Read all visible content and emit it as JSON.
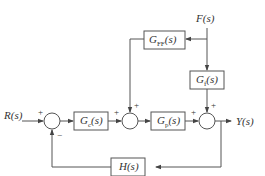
{
  "diagram": {
    "type": "control-block-diagram",
    "signals": {
      "input": "R(s)",
      "output": "Y(s)",
      "disturbance": "F(s)"
    },
    "blocks": {
      "controller": {
        "main": "G",
        "sub": "c",
        "arg": "(s)"
      },
      "plant": {
        "main": "G",
        "sub": "p",
        "arg": "(s)"
      },
      "feedforward": {
        "main": "G",
        "sub": "FF",
        "arg": "(s)"
      },
      "disturbance_path": {
        "main": "G",
        "sub": "f",
        "arg": "(s)"
      },
      "feedback": {
        "main": "H",
        "sub": "",
        "arg": "(s)"
      }
    },
    "summing_junctions": {
      "error": {
        "signs": {
          "left": "+",
          "bottom": "−"
        }
      },
      "feedforward_sum": {
        "signs": {
          "left": "+",
          "top": "+"
        }
      },
      "output_sum": {
        "signs": {
          "left": "+",
          "top": "+"
        }
      }
    },
    "connections": [
      "R(s) → error sum (+)",
      "error sum → Gc(s)",
      "Gc(s) → feedforward sum (+)",
      "F(s) → GFF(s) → feedforward sum (+)",
      "feedforward sum → Gp(s)",
      "Gp(s) → output sum (+)",
      "F(s) → Gf(s) → output sum (+)",
      "output sum → Y(s)",
      "Y(s) → H(s) → error sum (−)"
    ]
  }
}
